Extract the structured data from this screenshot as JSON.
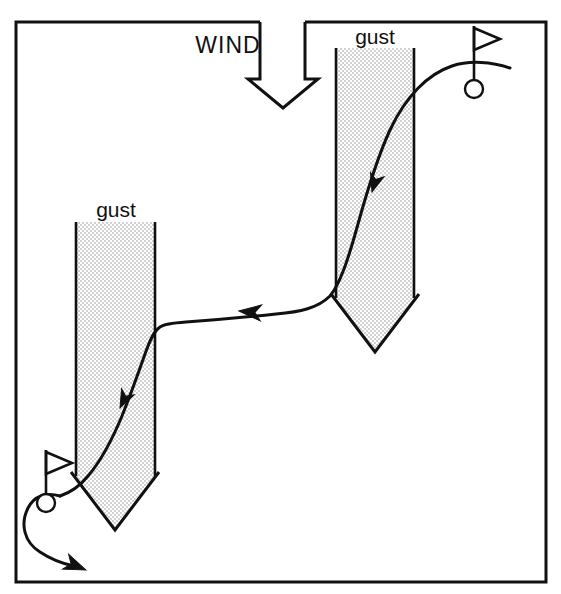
{
  "figure": {
    "background_color": "#ffffff",
    "ink_color": "#111111",
    "gust_fill_color": "#e4e4e4",
    "frame": {
      "x": 15,
      "y": 21,
      "width": 533,
      "height": 562,
      "stroke_width": 3
    }
  },
  "labels": {
    "wind": "WIND",
    "gust_right": "gust",
    "gust_left": "gust"
  },
  "wind_arrow": {
    "name": "wind-arrow",
    "direction": "down",
    "shaft_left_x": 260,
    "shaft_right_x": 305,
    "tip_x": 283,
    "tip_y": 107
  },
  "gust_columns": [
    {
      "name": "gust-column-right",
      "label": "gust",
      "label_x": 375,
      "label_y": 40,
      "left_x": 336,
      "right_x": 414,
      "top_y": 48,
      "body_bottom_y": 298,
      "tip_y": 352
    },
    {
      "name": "gust-column-left",
      "label": "gust",
      "label_x": 115,
      "label_y": 213,
      "left_x": 76,
      "right_x": 155,
      "top_y": 222,
      "body_bottom_y": 476,
      "tip_y": 530
    }
  ],
  "holes": [
    {
      "name": "hole-top-right",
      "circle_cx": 474,
      "circle_cy": 89,
      "circle_r": 9,
      "pole_x": 474,
      "pole_top_y": 26,
      "pole_bottom_y": 80,
      "flag_tip_x": 500,
      "flag_top_y": 28,
      "flag_bottom_y": 50
    },
    {
      "name": "hole-bottom-left",
      "circle_cx": 46,
      "circle_cy": 503,
      "circle_r": 9,
      "pole_x": 46,
      "pole_top_y": 450,
      "pole_bottom_y": 494,
      "flag_tip_x": 72,
      "flag_top_y": 452,
      "flag_bottom_y": 474
    }
  ],
  "trajectory": {
    "name": "ball-trajectory",
    "description": "Ball flight from the top-right hole, blown down through the right gust, drifting left across the middle, then down through the left gust toward the bottom-left hole",
    "arrowheads": [
      {
        "name": "trajectory-arrowhead-right-gust",
        "x": 372,
        "y": 190,
        "angle_deg": 62
      },
      {
        "name": "trajectory-arrowhead-middle",
        "x": 241,
        "y": 311,
        "angle_deg": 191
      },
      {
        "name": "trajectory-arrowhead-left-gust",
        "x": 118,
        "y": 410,
        "angle_deg": 119
      }
    ]
  },
  "rollout": {
    "name": "ball-rollout-curve",
    "description": "Curved path looping past the bottom-left hole and running off toward the lower right",
    "arrowhead": {
      "x": 82,
      "y": 561,
      "angle_deg": 40
    }
  }
}
